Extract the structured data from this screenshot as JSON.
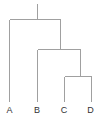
{
  "figure": {
    "type": "dendrogram",
    "hierarchy": {
      "root": [
        "A",
        [
          "B",
          [
            "C",
            "D"
          ]
        ]
      ]
    },
    "colors": {
      "background": "#ffffff",
      "branch": "#a0a0a0",
      "label": "#333333"
    },
    "leaves": [
      {
        "label": "A",
        "x": 9.5,
        "label_y": 113
      },
      {
        "label": "B",
        "x": 37,
        "label_y": 113
      },
      {
        "label": "C",
        "x": 64,
        "label_y": 113
      },
      {
        "label": "D",
        "x": 90.5,
        "label_y": 113
      }
    ],
    "branches": [
      {
        "name": "root-stem",
        "x1": 37.5,
        "y1": 4,
        "x2": 37.5,
        "y2": 19.5
      },
      {
        "name": "root-bar",
        "x1": 9.5,
        "y1": 19.5,
        "x2": 60.5,
        "y2": 19.5
      },
      {
        "name": "leaf-A-leg",
        "x1": 9.5,
        "y1": 19.5,
        "x2": 9.5,
        "y2": 102
      },
      {
        "name": "cluster-BCD-stem",
        "x1": 60.5,
        "y1": 19.5,
        "x2": 60.5,
        "y2": 49.5
      },
      {
        "name": "cluster-BCD-bar",
        "x1": 37.5,
        "y1": 49.5,
        "x2": 80.5,
        "y2": 49.5
      },
      {
        "name": "leaf-B-leg",
        "x1": 37.5,
        "y1": 49.5,
        "x2": 37.5,
        "y2": 102
      },
      {
        "name": "cluster-CD-stem",
        "x1": 80.5,
        "y1": 49.5,
        "x2": 80.5,
        "y2": 76.5
      },
      {
        "name": "cluster-CD-bar",
        "x1": 64.5,
        "y1": 76.5,
        "x2": 91.5,
        "y2": 76.5
      },
      {
        "name": "leaf-C-leg",
        "x1": 64.5,
        "y1": 76.5,
        "x2": 64.5,
        "y2": 102
      },
      {
        "name": "leaf-D-leg",
        "x1": 91.5,
        "y1": 76.5,
        "x2": 91.5,
        "y2": 102
      }
    ]
  }
}
